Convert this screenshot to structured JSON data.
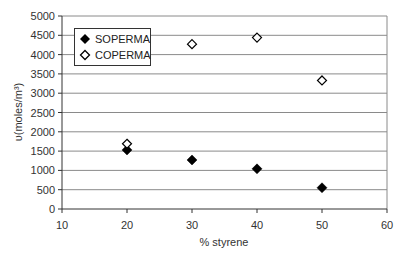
{
  "chart_data": {
    "type": "scatter",
    "title": "",
    "xlabel": "% styrene",
    "ylabel": "υ(moles/m³)",
    "xlim": [
      10,
      60
    ],
    "ylim": [
      0,
      5000
    ],
    "x_ticks": [
      10,
      20,
      30,
      40,
      50,
      60
    ],
    "y_ticks": [
      0,
      500,
      1000,
      1500,
      2000,
      2500,
      3000,
      3500,
      4000,
      4500,
      5000
    ],
    "grid": {
      "horizontal": true,
      "vertical": false
    },
    "legend_position": "upper-left inside plot",
    "series": [
      {
        "name": "SOPERMA",
        "marker": "filled-diamond",
        "color": "#000000",
        "x": [
          20,
          30,
          40,
          50
        ],
        "y": [
          1530,
          1270,
          1040,
          550
        ]
      },
      {
        "name": "COPERMA",
        "marker": "open-diamond",
        "color": "#000000",
        "x": [
          20,
          30,
          40,
          50
        ],
        "y": [
          1690,
          4270,
          4440,
          3330
        ]
      }
    ]
  },
  "legend": {
    "items": [
      {
        "label": "SOPERMA"
      },
      {
        "label": "COPERMA"
      }
    ]
  },
  "axes": {
    "xlabel": "% styrene",
    "ylabel": "υ(moles/m³)"
  }
}
